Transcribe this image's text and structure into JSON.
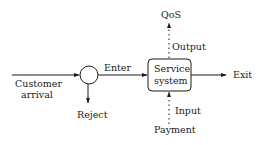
{
  "diagram": {
    "nodes": {
      "decision": {
        "shape": "circle"
      },
      "service": {
        "line1": "Service",
        "line2": "system"
      }
    },
    "labels": {
      "customer_arrival_1": "Customer",
      "customer_arrival_2": "arrival",
      "enter": "Enter",
      "reject": "Reject",
      "exit": "Exit",
      "qos": "QoS",
      "output": "Output",
      "input": "Input",
      "payment": "Payment"
    },
    "edges": [
      {
        "from": "Customer arrival",
        "to": "decision",
        "style": "solid"
      },
      {
        "from": "decision",
        "to": "Service system",
        "label": "Enter",
        "style": "solid"
      },
      {
        "from": "decision",
        "to": "Reject",
        "style": "solid"
      },
      {
        "from": "Service system",
        "to": "Exit",
        "style": "solid"
      },
      {
        "from": "Service system",
        "to": "QoS",
        "label": "Output",
        "style": "dotted"
      },
      {
        "from": "Payment",
        "to": "Service system",
        "label": "Input",
        "style": "dotted"
      }
    ],
    "colors": {
      "stroke": "#1a1a1a",
      "background": "#ffffff"
    }
  }
}
